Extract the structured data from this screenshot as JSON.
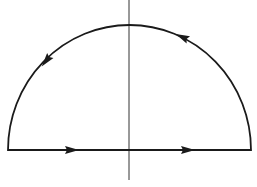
{
  "diagram": {
    "type": "semicircular-contour",
    "colors": {
      "stroke": "#1a1a1a",
      "axis": "#333333",
      "background": "#ffffff"
    },
    "contour": {
      "baseline": {
        "x1": 8,
        "x2": 251,
        "y": 150
      },
      "arc": {
        "cx": 129.5,
        "cy": 150,
        "rx": 121.5,
        "ry": 125
      },
      "direction": "counterclockwise",
      "arrows": [
        {
          "segment": "baseline-left",
          "x": 72,
          "y": 150,
          "angle": 0
        },
        {
          "segment": "baseline-right",
          "x": 188,
          "y": 150,
          "angle": 0
        },
        {
          "segment": "arc-right",
          "x": 182,
          "y": 37,
          "angle": 205
        },
        {
          "segment": "arc-left",
          "x": 46,
          "y": 61,
          "angle": 128
        }
      ]
    },
    "axis": {
      "x": 129,
      "y1": 0,
      "y2": 180
    }
  }
}
